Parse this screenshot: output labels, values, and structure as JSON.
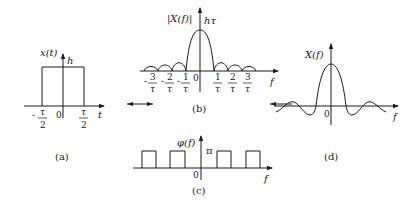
{
  "panels": {
    "a": {
      "caption": "(a)",
      "y_label": "x(t)",
      "amplitude_label": "h",
      "x_axis_label": "t",
      "origin_label": "0",
      "ticks": [
        {
          "sign": "-",
          "num": "τ",
          "den": "2"
        },
        {
          "sign": "",
          "num": "τ",
          "den": "2"
        }
      ]
    },
    "b": {
      "caption": "(b)",
      "y_label": "|X(f)|",
      "peak_label": "hτ",
      "x_axis_label": "f",
      "origin_label": "0",
      "ticks": [
        {
          "sign": "-",
          "num": "3",
          "den": "τ"
        },
        {
          "sign": "-",
          "num": "2",
          "den": "τ"
        },
        {
          "sign": "-",
          "num": "1",
          "den": "τ"
        },
        {
          "sign": "",
          "num": "1",
          "den": "τ"
        },
        {
          "sign": "",
          "num": "2",
          "den": "τ"
        },
        {
          "sign": "",
          "num": "3",
          "den": "τ"
        }
      ]
    },
    "c": {
      "caption": "(c)",
      "y_label": "φ(f)",
      "level_label": "π",
      "x_axis_label": "f",
      "origin_label": "0"
    },
    "d": {
      "caption": "(d)",
      "y_label": "X(f)",
      "x_axis_label": "f",
      "origin_label": "0"
    }
  },
  "colors": {
    "ink": "#1a1a1a",
    "background": "#ffffff"
  }
}
